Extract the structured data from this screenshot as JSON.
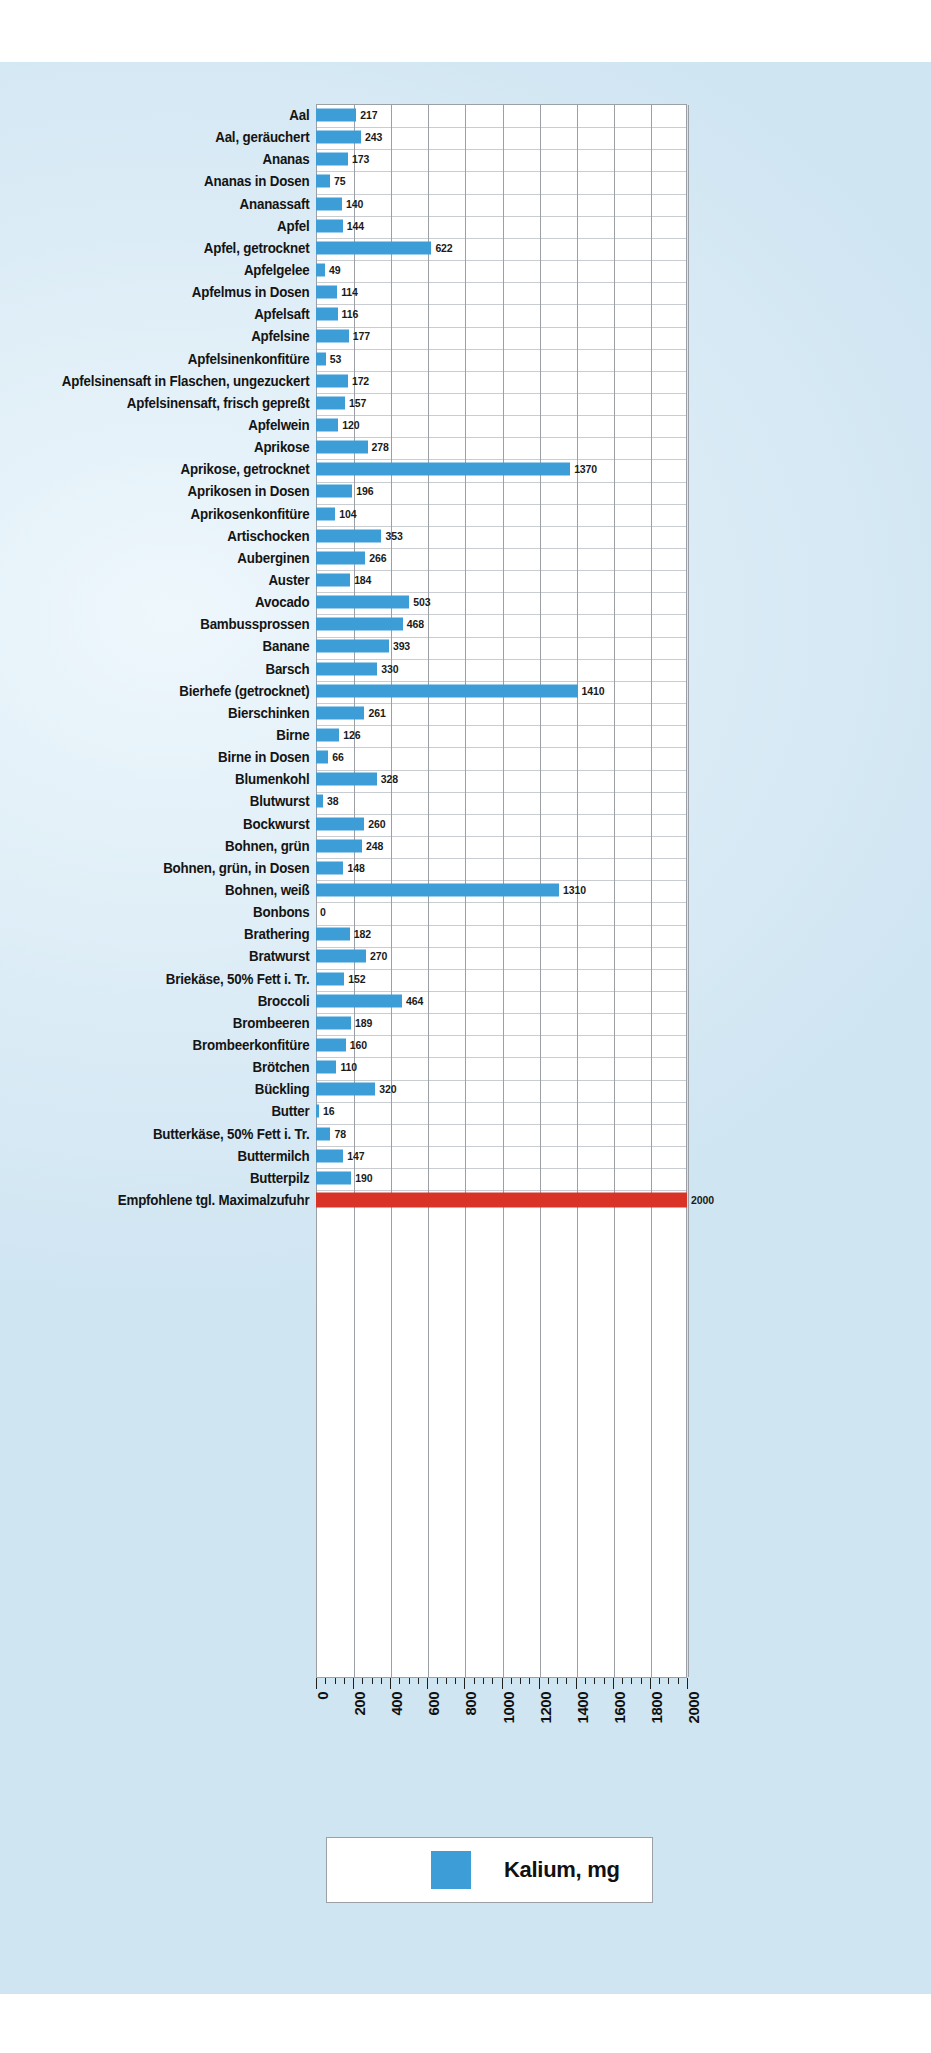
{
  "chart_data": {
    "type": "bar",
    "orientation": "horizontal",
    "title": "",
    "xlabel": "",
    "ylabel": "",
    "unit": "mg",
    "nutrient": "Kalium",
    "legend": {
      "label": "Kalium, mg",
      "color": "#3d9dd7",
      "position": "bottom-center"
    },
    "grid": true,
    "xlim": [
      0,
      2000
    ],
    "xticks": [
      0,
      200,
      400,
      600,
      800,
      1000,
      1200,
      1400,
      1600,
      1800,
      2000
    ],
    "xticklabels": [
      "0",
      "200",
      "400",
      "600",
      "800",
      "1000",
      "1200",
      "1400",
      "1600",
      "1800",
      "2000"
    ],
    "minor_tick_step": 50,
    "bar_color": "#3d9dd7",
    "reference_color": "#d93328",
    "categories": [
      "Aal",
      "Aal, geräuchert",
      "Ananas",
      "Ananas in Dosen",
      "Ananassaft",
      "Apfel",
      "Apfel, getrocknet",
      "Apfelgelee",
      "Apfelmus in Dosen",
      "Apfelsaft",
      "Apfelsine",
      "Apfelsinenkonfitüre",
      "Apfelsinensaft in Flaschen, ungezuckert",
      "Apfelsinensaft, frisch gepreßt",
      "Apfelwein",
      "Aprikose",
      "Aprikose, getrocknet",
      "Aprikosen in Dosen",
      "Aprikosenkonfitüre",
      "Artischocken",
      "Auberginen",
      "Auster",
      "Avocado",
      "Bambussprossen",
      "Banane",
      "Barsch",
      "Bierhefe (getrocknet)",
      "Bierschinken",
      "Birne",
      "Birne in Dosen",
      "Blumenkohl",
      "Blutwurst",
      "Bockwurst",
      "Bohnen, grün",
      "Bohnen, grün, in Dosen",
      "Bohnen, weiß",
      "Bonbons",
      "Brathering",
      "Bratwurst",
      "Briekäse, 50% Fett i. Tr.",
      "Broccoli",
      "Brombeeren",
      "Brombeerkonfitüre",
      "Brötchen",
      "Bückling",
      "Butter",
      "Butterkäse, 50% Fett i. Tr.",
      "Buttermilch",
      "Butterpilz",
      "Empfohlene tgl. Maximalzufuhr"
    ],
    "values": [
      217,
      243,
      173,
      75,
      140,
      144,
      622,
      49,
      114,
      116,
      177,
      53,
      172,
      157,
      120,
      278,
      1370,
      196,
      104,
      353,
      266,
      184,
      503,
      468,
      393,
      330,
      1410,
      261,
      126,
      66,
      328,
      38,
      260,
      248,
      148,
      1310,
      0,
      182,
      270,
      152,
      464,
      189,
      160,
      110,
      320,
      16,
      78,
      147,
      190,
      2000
    ],
    "reference_row_index": 49
  }
}
